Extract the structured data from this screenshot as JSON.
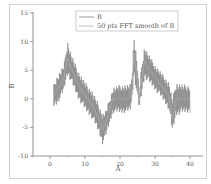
{
  "chart_data": {
    "type": "line",
    "title": "",
    "xlabel": "A",
    "ylabel": "B",
    "xlim": [
      -5,
      43
    ],
    "ylim": [
      -10,
      15
    ],
    "x_ticks": [
      0,
      10,
      20,
      30,
      40
    ],
    "y_ticks": [
      -10,
      -5,
      0,
      5,
      10,
      15
    ],
    "x_tick_labels": [
      "0",
      "10",
      "20",
      "30",
      "40"
    ],
    "y_tick_labels": [
      "-10",
      "-5",
      "0",
      "5",
      "10",
      "15"
    ],
    "grid": false,
    "legend_position": "top-right (inside)",
    "series": [
      {
        "name": "B",
        "color": "#808080",
        "style": "noisy oscillating signal, amplitude about ±2.5 around trend",
        "x": [
          1,
          2,
          3,
          4,
          5,
          6,
          8,
          10,
          12,
          14,
          15,
          16,
          18,
          20,
          22,
          23,
          23.5,
          24,
          25,
          25.5,
          26,
          27,
          28,
          30,
          32,
          34,
          35,
          36,
          38,
          40
        ],
        "upper": [
          2.5,
          4,
          5,
          6,
          10.3,
          8,
          5,
          3,
          1.5,
          -1,
          -2.5,
          -2,
          2,
          2.5,
          2.5,
          2.5,
          5,
          11.5,
          6,
          1,
          5,
          9.3,
          8,
          6,
          4.5,
          3,
          0,
          3,
          2.5,
          2.5
        ],
        "lower": [
          -1.5,
          -1,
          0,
          1.5,
          4,
          3,
          0,
          -2,
          -3.5,
          -6,
          -8,
          -6.5,
          -2.5,
          -2.5,
          -2.5,
          -2,
          0,
          4,
          0,
          -1.8,
          0,
          3.5,
          3,
          1.5,
          0,
          -2,
          -6,
          -3,
          -2.5,
          -2.5
        ]
      },
      {
        "name": "50 pts FFT smooth of B",
        "color": "#b0b0b0",
        "x": [
          1,
          2,
          3,
          4,
          5,
          6,
          8,
          10,
          12,
          14,
          15,
          16,
          18,
          20,
          22,
          23,
          23.5,
          24,
          25,
          25.5,
          26,
          27,
          28,
          30,
          32,
          34,
          35,
          36,
          38,
          40
        ],
        "values": [
          0.5,
          1.5,
          2.5,
          3.8,
          7,
          5.5,
          2.5,
          0.5,
          -1,
          -3.5,
          -5.5,
          -4,
          0,
          0,
          0,
          0.2,
          2.5,
          8,
          3,
          -0.5,
          2.5,
          6.5,
          5.5,
          3.8,
          2.2,
          0.5,
          -3.5,
          0,
          0,
          0
        ]
      }
    ]
  },
  "legend": {
    "items": [
      {
        "label": "B",
        "color": "#808080"
      },
      {
        "label": "50 pts FFT smooth of B",
        "color": "#b0b0b0"
      }
    ]
  },
  "axes": {
    "x_title": "A",
    "y_title": "B",
    "x_tick_labels": [
      "0",
      "10",
      "20",
      "30",
      "40"
    ],
    "y_tick_labels": [
      "15",
      "10",
      "5",
      "0",
      "-5",
      "-10"
    ]
  }
}
